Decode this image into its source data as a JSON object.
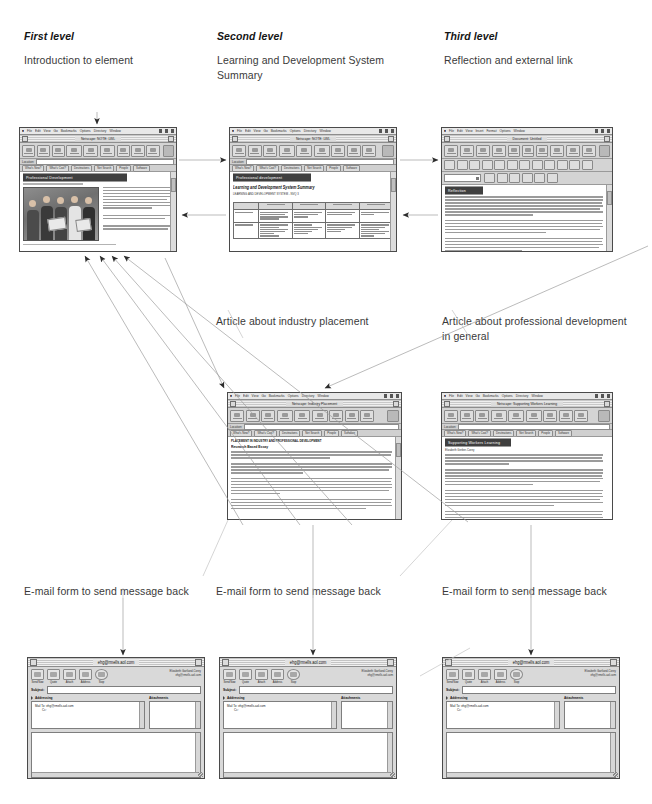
{
  "diagram": {
    "column_headings": [
      {
        "title": "First level",
        "desc": "Introduction to element"
      },
      {
        "title": "Second level",
        "desc": "Learning and Development System Summary"
      },
      {
        "title": "Third level",
        "desc": "Reflection and external link"
      }
    ],
    "mid_labels": [
      "Article about industry placement",
      "Article about professional development in general"
    ],
    "bottom_labels": [
      "E-mail form to send message back",
      "E-mail form to send message back",
      "E-mail form to send message back"
    ]
  },
  "browser": {
    "menus": [
      "File",
      "Edit",
      "View",
      "Go",
      "Bookmarks",
      "Options",
      "Directory",
      "Window"
    ],
    "location_label": "Location:",
    "directory_buttons": [
      "What's New?",
      "What's Cool?",
      "Destinations",
      "Net Search",
      "People",
      "Software"
    ],
    "toolbar_labels": [
      "Back",
      "Forward",
      "Home",
      "Edit",
      "Reload",
      "Images",
      "Open",
      "Print",
      "Find",
      "Stop"
    ]
  },
  "composer": {
    "menus": [
      "File",
      "Edit",
      "View",
      "Insert",
      "Format",
      "Options",
      "Window"
    ],
    "toolbar_labels": [
      "New",
      "Open",
      "Save",
      "Browse",
      "Cut",
      "Copy",
      "Paste",
      "Print",
      "Find",
      "Publish"
    ],
    "paragraph_style": "Normal"
  },
  "windows": {
    "w1": {
      "title": "Netscape: NOTE: LWL",
      "page_heading": "Professional Development",
      "caption": "Fig: Learning and development in the workplace"
    },
    "w2": {
      "title": "Netscape: NOTE: LWL",
      "page_heading": "Professional development",
      "subheading": "Learning and Development System Summary",
      "subtitle": "LEARNING AND DEVELOPMENT SYSTEM - NVQ 3",
      "table_headers": [
        "",
        "INPUT",
        "PROCESSING",
        "OUTPUT",
        "FEEDBACK"
      ],
      "row_labels": [
        "Providers",
        "Offerings"
      ]
    },
    "w3": {
      "title": "Document: Untitled",
      "page_heading": "Reflection"
    },
    "w4": {
      "title": "Netscape: Industry Placement",
      "page_heading": "Research Based Essay",
      "kicker": "PLACEMENT IN INDUSTRY AND PROFESSIONAL DEVELOPMENT"
    },
    "w5": {
      "title": "Netscape: Supporting Workers Learning",
      "page_heading": "Supporting Workers Learning",
      "kicker": "Elizabeth Gerber-Corey"
    }
  },
  "email": {
    "title": "ehg@rmells.aol.com",
    "toolbar": [
      {
        "label": "Send Now",
        "icon": "send-icon"
      },
      {
        "label": "Quote",
        "icon": "quote-icon"
      },
      {
        "label": "Attach",
        "icon": "attach-icon"
      },
      {
        "label": "Address",
        "icon": "address-icon"
      },
      {
        "label": "Stop",
        "icon": "stop-icon"
      }
    ],
    "from_line_1": "Elizabeth Gartland-Corey",
    "from_line_2": "ehg@rmells.aol.com",
    "subject_label": "Subject:",
    "subject_value": "",
    "addressing_label": "Addressing",
    "attachments_label": "Attachments",
    "mail_to_label": "Mail To:",
    "mail_to_value": "ehg@rmells.aol.com",
    "cc_label": "Cc:",
    "body_value": ""
  },
  "colors": {
    "page_bg": "#ffffff",
    "chrome": "#d0d0d0",
    "heading_bar": "#3f3f3f",
    "text": "#3a3a3a",
    "arrow": "#4a4a4a"
  }
}
